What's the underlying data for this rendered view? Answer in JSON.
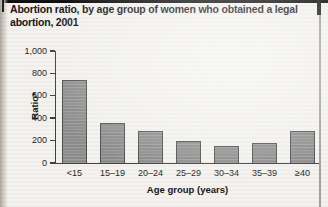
{
  "figure_title": "Abortion ratio, by age group of women who obtained a legal abortion, 2001",
  "chart_data": {
    "type": "bar",
    "title": "Abortion ratio, by age group of women who obtained a legal abortion, 2001",
    "categories": [
      "<15",
      "15–19",
      "20–24",
      "25–29",
      "30–34",
      "35–39",
      "≥40"
    ],
    "values": [
      740,
      355,
      290,
      195,
      150,
      180,
      285
    ],
    "xlabel": "Age group (years)",
    "ylabel": "Ratio*",
    "ylim": [
      0,
      1000
    ],
    "yticks": [
      0,
      200,
      400,
      600,
      800,
      1000
    ],
    "ytick_labels": [
      "0",
      "200",
      "400",
      "600",
      "800",
      "1,000"
    ],
    "grid": false,
    "legend": "none",
    "bar_fill_color": "#919191",
    "bar_border_color": "#4a4a4a",
    "axis_color": "#3a3a3a",
    "background_color": "#f3f2ef",
    "title_color": "#101010"
  }
}
